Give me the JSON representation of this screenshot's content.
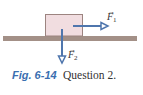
{
  "diagram": {
    "ground": {
      "color": "#a39087"
    },
    "block": {
      "fill": "#f1dde0",
      "stroke": "#9c8480"
    },
    "arrow_color": "#4f76ad",
    "forces": [
      {
        "id": "F1",
        "symbol": "F",
        "subscript": "1",
        "vector_mark": "→",
        "direction": "right"
      },
      {
        "id": "F2",
        "symbol": "F",
        "subscript": "2",
        "vector_mark": "→",
        "direction": "down"
      }
    ]
  },
  "caption": {
    "figure_label": "Fig. 6-14",
    "text": "Question 2.",
    "label_color": "#3b6fb0"
  }
}
